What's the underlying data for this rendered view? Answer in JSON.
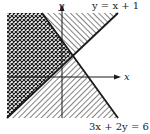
{
  "figure": {
    "type": "graph of system of linear inequalities",
    "axes": {
      "x_label": "x",
      "y_label": "y"
    },
    "lines": [
      {
        "id": "line1",
        "equation": "y = x + 1",
        "label": "y = x + 1",
        "style": "solid bold"
      },
      {
        "id": "line2",
        "equation": "3x + 2y = 6",
        "label": "3x + 2y = 6",
        "style": "solid bold"
      }
    ],
    "regions": [
      {
        "id": "above-line1",
        "description": "region above y = x + 1",
        "pattern": "diagonal hatch"
      },
      {
        "id": "below-line2",
        "description": "region below 3x + 2y = 6",
        "pattern": "diagonal hatch"
      },
      {
        "id": "overlap",
        "description": "solution region: above y = x + 1 and below 3x + 2y = 6",
        "pattern": "crosshatch"
      }
    ],
    "colors": {
      "ink": "#1a1a1a",
      "background": "#ffffff"
    }
  }
}
